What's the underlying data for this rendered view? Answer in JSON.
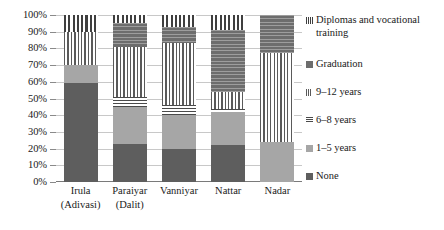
{
  "chart_data": {
    "type": "bar",
    "stacked": true,
    "stack_mode": "percent",
    "title": "",
    "subtitle": "",
    "xlabel": "",
    "ylabel": "",
    "ylim": [
      0,
      100
    ],
    "ytick_labels": [
      "0%",
      "10%",
      "20%",
      "30%",
      "40%",
      "50%",
      "60%",
      "70%",
      "80%",
      "90%",
      "100%"
    ],
    "ytick_values": [
      0,
      10,
      20,
      30,
      40,
      50,
      60,
      70,
      80,
      90,
      100
    ],
    "grid": true,
    "grid_axis": "y",
    "legend_position": "right",
    "categories": [
      "Irula (Adivasi)",
      "Paraiyar (Dalit)",
      "Vanniyar",
      "Nattar",
      "Nadar"
    ],
    "category_lines": [
      [
        "Irula",
        "(Adivasi)"
      ],
      [
        "Paraiyar",
        "(Dalit)"
      ],
      [
        "Vanniyar",
        ""
      ],
      [
        "Nattar",
        ""
      ],
      [
        "Nadar",
        ""
      ]
    ],
    "series": [
      {
        "name": "None",
        "key": "none",
        "pattern": "solid-dark",
        "color": "#5e5e5e",
        "values": [
          59,
          23,
          20,
          22,
          0
        ]
      },
      {
        "name": "1–5 years",
        "key": "y1_5",
        "pattern": "solid-light-gray",
        "color": "#a6a6a6",
        "values": [
          11,
          22,
          20,
          20,
          24
        ]
      },
      {
        "name": "6–8 years",
        "key": "y6_8",
        "pattern": "horizontal-lines",
        "color": "#4a4a4a",
        "values": [
          0,
          6,
          6,
          2,
          0
        ]
      },
      {
        "name": "9–12 years",
        "key": "y9_12",
        "pattern": "vertical-thin-lines",
        "color": "#5a5a5a",
        "values": [
          20,
          30,
          37,
          10,
          53
        ]
      },
      {
        "name": "Graduation",
        "key": "grad",
        "pattern": "dark-hatched",
        "color": "#6d6d6d",
        "values": [
          0,
          14,
          10,
          37,
          23
        ]
      },
      {
        "name": "Diplomas and vocational training",
        "key": "dipl",
        "pattern": "vertical-thick-lines",
        "color": "#3f3f3f",
        "values": [
          10,
          5,
          7,
          9,
          0
        ]
      }
    ]
  },
  "legend": {
    "entries": [
      {
        "label": "Diplomas and vocational\ntraining",
        "swatch": "dipl"
      },
      {
        "label": "Graduation",
        "swatch": "grad"
      },
      {
        "label": "9–12 years",
        "swatch": "9-12"
      },
      {
        "label": "6–8 years",
        "swatch": "6-8"
      },
      {
        "label": "1–5 years",
        "swatch": "1-5"
      },
      {
        "label": "None",
        "swatch": "none"
      }
    ]
  }
}
